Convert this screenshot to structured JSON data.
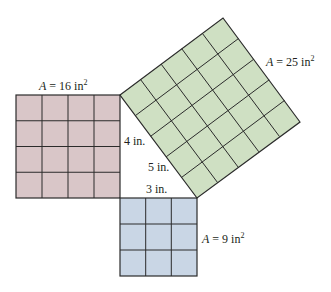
{
  "diagram": {
    "type": "pythagorean-theorem-squares",
    "colors": {
      "square_a": "#d9c6c8",
      "square_b": "#c9d6e5",
      "square_c": "#cfe0c3",
      "grid_line": "#2b2b2b",
      "background": "#ffffff"
    },
    "squares": [
      {
        "id": "square-a",
        "side": 4,
        "grid": 4,
        "area_label_var": "A",
        "area_label_eq": " = 16 in",
        "area_label_sup": "2"
      },
      {
        "id": "square-b",
        "side": 3,
        "grid": 3,
        "area_label_var": "A",
        "area_label_eq": " = 9 in",
        "area_label_sup": "2"
      },
      {
        "id": "square-c",
        "side": 5,
        "grid": 5,
        "area_label_var": "A",
        "area_label_eq": " = 25 in",
        "area_label_sup": "2"
      }
    ],
    "triangle_labels": {
      "leg_a": "4 in.",
      "leg_b": "3 in.",
      "hypotenuse": "5 in."
    }
  }
}
